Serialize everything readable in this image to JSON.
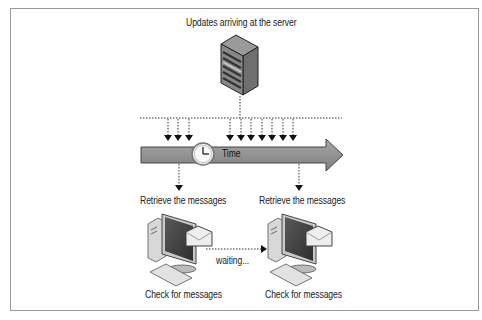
{
  "diagram": {
    "title": "Updates arriving at the server",
    "timeline_label": "Time",
    "retrieve_label_1": "Retrieve the messages",
    "retrieve_label_2": "Retrieve the messages",
    "waiting_label": "waiting...",
    "check_label_1": "Check for messages",
    "check_label_2": "Check for messages",
    "nodes": [
      {
        "id": "server",
        "type": "server-icon",
        "label": "Updates arriving at the server"
      },
      {
        "id": "timeline",
        "type": "arrow",
        "label": "Time"
      },
      {
        "id": "client-1",
        "type": "computer-icon",
        "label": "Check for messages"
      },
      {
        "id": "client-2",
        "type": "computer-icon",
        "label": "Check for messages"
      }
    ],
    "edges": [
      {
        "from": "client-1",
        "to": "client-2",
        "label": "waiting...",
        "style": "dotted"
      },
      {
        "from": "timeline",
        "to": "client-1",
        "label": "Retrieve the messages",
        "style": "dotted"
      },
      {
        "from": "timeline",
        "to": "client-2",
        "label": "Retrieve the messages",
        "style": "dotted"
      }
    ],
    "update_arrow_groups": [
      3,
      7
    ],
    "colors": {
      "arrow_fill": "#8f8f8f",
      "arrow_border": "#555555",
      "border": "#9a9a9a",
      "text": "#222222"
    }
  }
}
